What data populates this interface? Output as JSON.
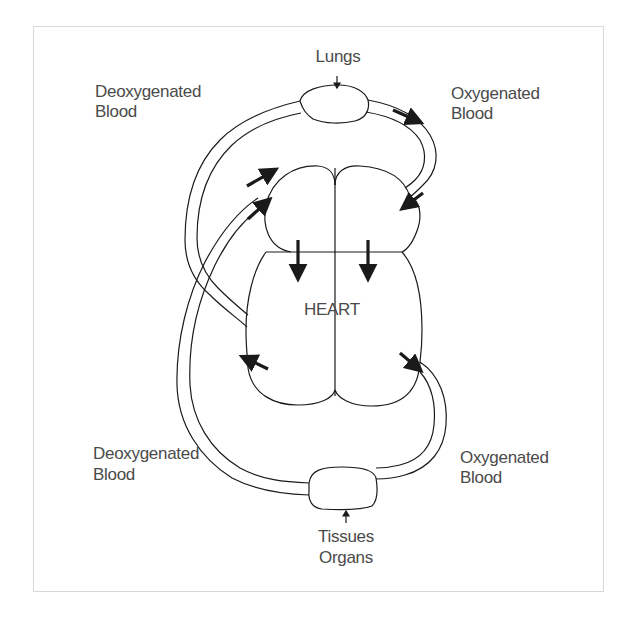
{
  "diagram": {
    "title_labels": {
      "lungs": "Lungs",
      "heart": "HEART",
      "tissues_line1": "Tissues",
      "tissues_line2": "Organs"
    },
    "side_labels": {
      "top_left_line1": "Deoxygenated",
      "top_left_line2": "Blood",
      "top_right_line1": "Oxygenated",
      "top_right_line2": "Blood",
      "bottom_left_line1": "Deoxygenated",
      "bottom_left_line2": "Blood",
      "bottom_right_line1": "Oxygenated",
      "bottom_right_line2": "Blood"
    },
    "nodes": [
      "Lungs",
      "HEART",
      "Tissues Organs"
    ],
    "flows": [
      {
        "from": "right atrium",
        "to": "right ventricle"
      },
      {
        "from": "left atrium",
        "to": "left ventricle"
      },
      {
        "from": "heart (right side)",
        "to": "Lungs",
        "blood": "Deoxygenated"
      },
      {
        "from": "Lungs",
        "to": "heart (left side)",
        "blood": "Oxygenated"
      },
      {
        "from": "heart (left side)",
        "to": "Tissues Organs",
        "blood": "Oxygenated"
      },
      {
        "from": "Tissues Organs",
        "to": "heart (right side)",
        "blood": "Deoxygenated"
      }
    ],
    "colors": {
      "line": "#1a1a1a",
      "text": "#4a4a4a",
      "frame": "#d8d8d8",
      "background": "#ffffff"
    }
  }
}
